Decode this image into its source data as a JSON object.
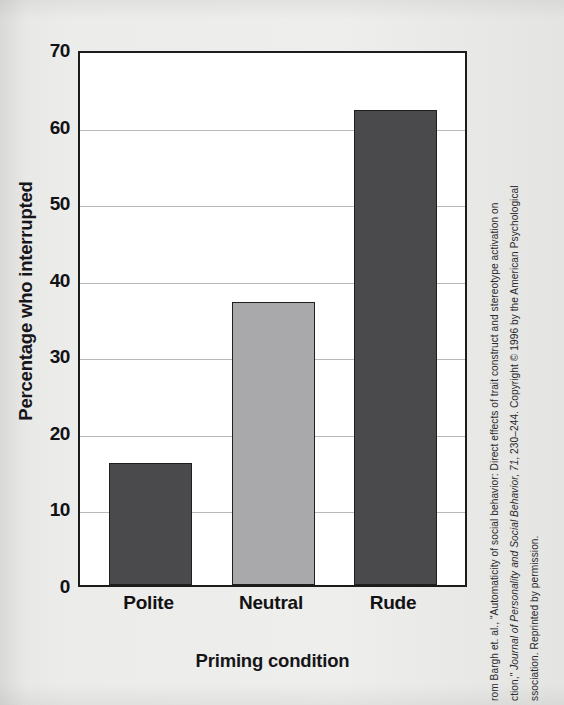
{
  "chart_data": {
    "type": "bar",
    "title": "",
    "categories": [
      "Polite",
      "Neutral",
      "Rude"
    ],
    "values": [
      16,
      37,
      62
    ],
    "xlabel": "Priming condition",
    "ylabel": "Percentage who interrupted",
    "ylim": [
      0,
      70
    ],
    "ytick_labels": [
      "0",
      "10",
      "20",
      "30",
      "40",
      "50",
      "60",
      "70"
    ],
    "ytick_values": [
      0,
      10,
      20,
      30,
      40,
      50,
      60,
      70
    ],
    "ytick_step": 10,
    "grid": true,
    "legend": "none",
    "bar_colors": [
      "#4a4a4c",
      "#a9a9ab",
      "#4a4a4c"
    ],
    "bar_edge_color": "#1f1f1f",
    "axis_color": "#1c1c1c",
    "gridline_color": "#b9b9b9",
    "plot_background": "#ffffff",
    "page_background": "#e9e9e7"
  },
  "credit": {
    "line1": "rom Bargh et. al., \"Automaticity of social behavior: Direct effects of trait construct and stereotype activation on",
    "line2": "ction,\" Journal of Personality and Social Behavior, 71, 230–244. Copyright © 1996 by the American Psychological",
    "line3": "ssociation. Reprinted by permission."
  }
}
